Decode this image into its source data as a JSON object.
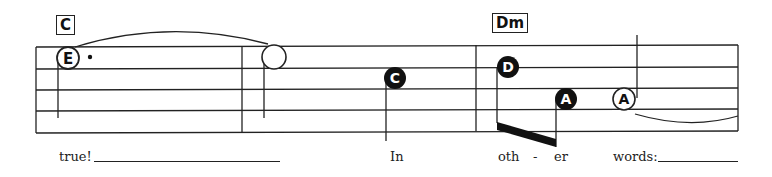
{
  "chords": [
    {
      "label": "C"
    },
    {
      "label": "Dm"
    }
  ],
  "notes": [
    {
      "letter": "E",
      "style": "open",
      "dotted": true
    },
    {
      "letter": "",
      "style": "open-blank"
    },
    {
      "letter": "C",
      "style": "filled"
    },
    {
      "letter": "D",
      "style": "filled"
    },
    {
      "letter": "A",
      "style": "filled"
    },
    {
      "letter": "A",
      "style": "open"
    }
  ],
  "lyrics": [
    {
      "text": "true!"
    },
    {
      "text": "In"
    },
    {
      "text": "oth"
    },
    {
      "text": "-"
    },
    {
      "text": "er"
    },
    {
      "text": "words:"
    }
  ],
  "colors": {
    "ink": "#222222",
    "paper": "#ffffff"
  }
}
